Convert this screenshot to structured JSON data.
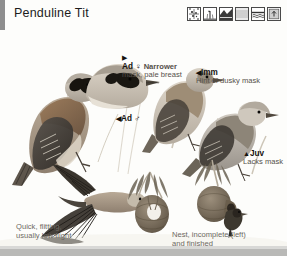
{
  "page": {
    "title": "Penduline Tit",
    "background_color": "#fdfdfb",
    "edge_bar_color": "#8e8e8e",
    "bottom_border_color": "#b9b9b7"
  },
  "symbols": [
    {
      "name": "distribution-map-icon",
      "label": "distribution map"
    },
    {
      "name": "reedbed-habitat-icon",
      "label": "reedbed habitat"
    },
    {
      "name": "wetland-habitat-icon",
      "label": "wetland habitat"
    },
    {
      "name": "scrub-habitat-icon",
      "label": "scrub habitat"
    },
    {
      "name": "water-habitat-icon",
      "label": "water habitat"
    },
    {
      "name": "nest-habitat-icon",
      "label": "nest habitat"
    }
  ],
  "labels": [
    {
      "id": "adult-female",
      "arrow": "▶",
      "arrow_position": "above",
      "head": "Ad",
      "sex": "♀",
      "lead": "Narrower",
      "body": "mask, pale breast"
    },
    {
      "id": "adult-male",
      "arrow": "◀",
      "arrow_position": "inline",
      "head": "Ad",
      "sex": "♂",
      "lead": "",
      "body": ""
    },
    {
      "id": "immature",
      "arrow": "◀",
      "arrow_position": "inline",
      "head": "Imm",
      "sex": "",
      "lead": "",
      "body": "Hint of dusky mask"
    },
    {
      "id": "juvenile",
      "arrow": "▲",
      "arrow_position": "inline",
      "head": "Juv",
      "sex": "",
      "lead": "",
      "body": "Lacks mask"
    }
  ],
  "captions": [
    {
      "id": "flight-caption",
      "line1": "Quick, flitting,",
      "line2": "usually low flight"
    },
    {
      "id": "nest-caption",
      "line1": "Nest, incomplete (left)",
      "line2": "and finished"
    }
  ],
  "plate": {
    "figures": [
      {
        "name": "adult-male-perched",
        "description": "adult male perched on reed stem, black face mask, chestnut back"
      },
      {
        "name": "adult-female-head",
        "description": "adult female head and shoulders, narrower mask, pale breast"
      },
      {
        "name": "immature-perched",
        "description": "immature bird perched, hint of dusky mask"
      },
      {
        "name": "juvenile-perched",
        "description": "juvenile perched, plain face lacking mask"
      },
      {
        "name": "bird-in-flight",
        "description": "bird in flight from below, wings spread"
      },
      {
        "name": "nest-incomplete",
        "description": "incomplete hanging nest on willow branch"
      },
      {
        "name": "nest-finished",
        "description": "finished pendulous nest with entrance tube, bird at entrance"
      }
    ]
  }
}
